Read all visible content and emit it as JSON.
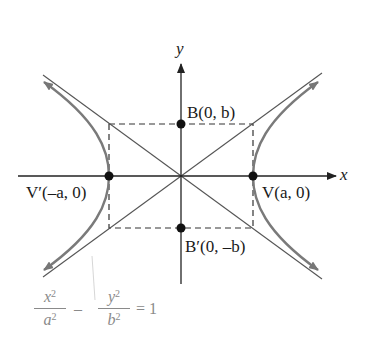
{
  "diagram": {
    "type": "hyperbola",
    "axes": {
      "x_label": "x",
      "y_label": "y"
    },
    "points": [
      {
        "id": "B",
        "label": "B(0, b)"
      },
      {
        "id": "B_prime",
        "label": "B′(0, –b)"
      },
      {
        "id": "V",
        "label": "V(a, 0)"
      },
      {
        "id": "V_prime",
        "label": "V′(–a, 0)"
      }
    ],
    "equation": {
      "lhs_num_1": "x",
      "lhs_den_1": "a",
      "operator": "–",
      "lhs_num_2": "y",
      "lhs_den_2": "b",
      "exponent": "2",
      "rhs": "= 1"
    },
    "colors": {
      "curve": "#7a7a7a",
      "axis": "#222222",
      "asymptote": "#555555",
      "box": "#333333",
      "point": "#111111",
      "equation": "#8a8a8a"
    }
  }
}
